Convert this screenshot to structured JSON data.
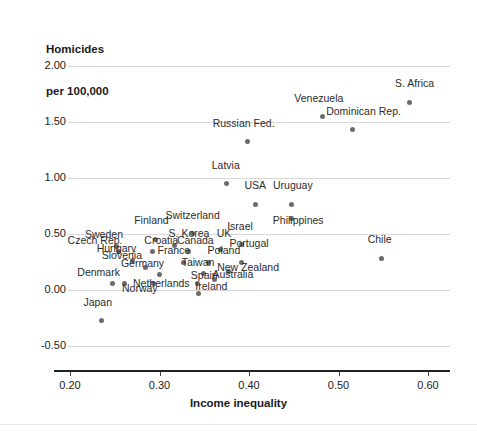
{
  "chart_data": {
    "type": "scatter",
    "title": "",
    "xlabel": "Income inequality",
    "ylabel": "Homicides\nper 100,000",
    "ylabel_line1": "Homicides",
    "ylabel_line2": "per 100,000",
    "xlim": [
      0.17,
      0.625
    ],
    "ylim": [
      -0.62,
      2.12
    ],
    "xticks": [
      "0.20",
      "0.30",
      "0.40",
      "0.50",
      "0.60"
    ],
    "xtick_values": [
      0.2,
      0.3,
      0.4,
      0.5,
      0.6
    ],
    "yticks": [
      "2.00",
      "1.50",
      "1.00",
      "0.50",
      "0.00",
      "-0.50"
    ],
    "ytick_values": [
      2.0,
      1.5,
      1.0,
      0.5,
      0.0,
      -0.5
    ],
    "grid": "horizontal",
    "legend": "none",
    "point_color": "#6b6b6b",
    "grid_color": "#d8d8d8",
    "axis_color": "#222222",
    "points": [
      {
        "label": "S. Africa",
        "x": 0.579,
        "y": 1.675,
        "lx": 0.585,
        "ly": 1.795,
        "align": "center"
      },
      {
        "label": "Venezuela",
        "x": 0.482,
        "y": 1.545,
        "lx": 0.478,
        "ly": 1.665,
        "align": "center"
      },
      {
        "label": "Dominican Rep.",
        "x": 0.516,
        "y": 1.43,
        "lx": 0.528,
        "ly": 1.545,
        "align": "center"
      },
      {
        "label": "Russian Fed.",
        "x": 0.398,
        "y": 1.325,
        "lx": 0.394,
        "ly": 1.44,
        "align": "center"
      },
      {
        "label": "Latvia",
        "x": 0.375,
        "y": 0.95,
        "lx": 0.374,
        "ly": 1.065,
        "align": "center"
      },
      {
        "label": "USA",
        "x": 0.407,
        "y": 0.76,
        "lx": 0.407,
        "ly": 0.88,
        "align": "center"
      },
      {
        "label": "Uruguay",
        "x": 0.447,
        "y": 0.76,
        "lx": 0.449,
        "ly": 0.88,
        "align": "center"
      },
      {
        "label": "Philippines",
        "x": 0.447,
        "y": 0.64,
        "lx": 0.455,
        "ly": 0.575,
        "align": "center"
      },
      {
        "label": "Israel",
        "x": 0.392,
        "y": 0.405,
        "lx": 0.39,
        "ly": 0.52,
        "align": "center"
      },
      {
        "label": "Portugal",
        "x": 0.392,
        "y": 0.245,
        "lx": 0.4,
        "ly": 0.365,
        "align": "center"
      },
      {
        "label": "Chile",
        "x": 0.548,
        "y": 0.285,
        "lx": 0.546,
        "ly": 0.4,
        "align": "center"
      },
      {
        "label": "Switzerland",
        "x": 0.337,
        "y": 0.505,
        "lx": 0.337,
        "ly": 0.62,
        "align": "center"
      },
      {
        "label": "Finland",
        "x": 0.296,
        "y": 0.45,
        "lx": 0.291,
        "ly": 0.57,
        "align": "center"
      },
      {
        "label": "Sweden",
        "x": 0.252,
        "y": 0.39,
        "lx": 0.238,
        "ly": 0.45,
        "align": "center"
      },
      {
        "label": "S. Korea",
        "x": 0.317,
        "y": 0.395,
        "lx": 0.333,
        "ly": 0.455,
        "align": "center"
      },
      {
        "label": "UK",
        "x": 0.368,
        "y": 0.365,
        "lx": 0.372,
        "ly": 0.455,
        "align": "center"
      },
      {
        "label": "Canada",
        "x": 0.332,
        "y": 0.345,
        "lx": 0.34,
        "ly": 0.395,
        "align": "center"
      },
      {
        "label": "Croatia",
        "x": 0.292,
        "y": 0.34,
        "lx": 0.302,
        "ly": 0.395,
        "align": "center"
      },
      {
        "label": "Czech Rep.",
        "x": 0.254,
        "y": 0.34,
        "lx": 0.228,
        "ly": 0.395,
        "align": "center"
      },
      {
        "label": "Hungary",
        "x": 0.27,
        "y": 0.26,
        "lx": 0.252,
        "ly": 0.32,
        "align": "center"
      },
      {
        "label": "France",
        "x": 0.327,
        "y": 0.245,
        "lx": 0.316,
        "ly": 0.3,
        "align": "center"
      },
      {
        "label": "Poland",
        "x": 0.355,
        "y": 0.25,
        "lx": 0.372,
        "ly": 0.3,
        "align": "center"
      },
      {
        "label": "Slovenia",
        "x": 0.284,
        "y": 0.205,
        "lx": 0.258,
        "ly": 0.255,
        "align": "center"
      },
      {
        "label": "Germany",
        "x": 0.3,
        "y": 0.135,
        "lx": 0.281,
        "ly": 0.185,
        "align": "center"
      },
      {
        "label": "Taiwan",
        "x": 0.349,
        "y": 0.15,
        "lx": 0.343,
        "ly": 0.2,
        "align": "center"
      },
      {
        "label": "New Zealand",
        "x": 0.377,
        "y": 0.165,
        "lx": 0.399,
        "ly": 0.15,
        "align": "center"
      },
      {
        "label": "Australia",
        "x": 0.362,
        "y": 0.095,
        "lx": 0.382,
        "ly": 0.09,
        "align": "center"
      },
      {
        "label": "Spain",
        "x": 0.342,
        "y": 0.055,
        "lx": 0.35,
        "ly": 0.08,
        "align": "center"
      },
      {
        "label": "Netherlands",
        "x": 0.293,
        "y": 0.055,
        "lx": 0.302,
        "ly": 0.005,
        "align": "center"
      },
      {
        "label": "Ireland",
        "x": 0.344,
        "y": -0.03,
        "lx": 0.358,
        "ly": -0.02,
        "align": "center"
      },
      {
        "label": "Denmark",
        "x": 0.247,
        "y": 0.055,
        "lx": 0.232,
        "ly": 0.105,
        "align": "center"
      },
      {
        "label": "Norway",
        "x": 0.261,
        "y": 0.055,
        "lx": 0.278,
        "ly": -0.04,
        "align": "center"
      },
      {
        "label": "Japan",
        "x": 0.235,
        "y": -0.275,
        "lx": 0.231,
        "ly": -0.165,
        "align": "center"
      }
    ]
  }
}
